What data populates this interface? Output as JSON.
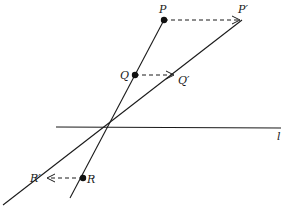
{
  "diagram": {
    "labels": {
      "P": "P",
      "P_prime": "P′",
      "Q": "Q",
      "Q_prime": "Q′",
      "R": "R",
      "R_prime": "R′",
      "l": "l"
    },
    "colors": {
      "ink": "#1a1a1a",
      "background": "#ffffff"
    }
  }
}
